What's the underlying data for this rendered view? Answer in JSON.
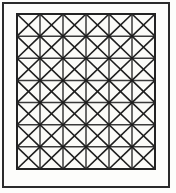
{
  "figure": {
    "background_color": "#fdfdfb",
    "outer_frame": {
      "name": "outer-frame",
      "x": 3,
      "y": 3,
      "width": 166,
      "height": 184,
      "stroke_color": "#2b2b2b",
      "stroke_width": 2,
      "fill": "none"
    },
    "grid": {
      "name": "diagonal-grid",
      "x": 17,
      "y": 14,
      "width": 138,
      "height": 155,
      "columns": 6,
      "rows": 7,
      "cell_width": 23,
      "cell_height": 22.142857142857142,
      "fill": "#fbfbf8",
      "border_stroke_color": "#232323",
      "border_stroke_width": 2.6,
      "line_stroke_color": "#3a3a3a",
      "line_stroke_width": 1.5,
      "diagonal_stroke_color": "#1e1e1e",
      "diagonal_stroke_width": 1.6,
      "diagonals_per_cell": "both",
      "total_cells": 42,
      "total_triangles": 168
    }
  }
}
